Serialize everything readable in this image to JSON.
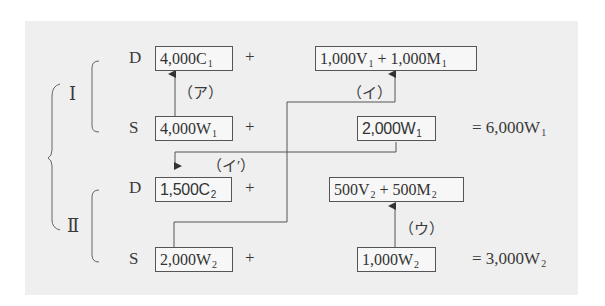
{
  "groups": {
    "I": {
      "label": "Ⅰ"
    },
    "II": {
      "label": "Ⅱ"
    }
  },
  "rows": {
    "I_D": {
      "prefix": "D",
      "c_box": {
        "value": "4,000C",
        "sub": "1"
      },
      "plus": "+",
      "vm_box": {
        "v": "1,000V",
        "v_sub": "1",
        "op": " + ",
        "m": "1,000M",
        "m_sub": "1"
      }
    },
    "I_S": {
      "prefix": "S",
      "w_box": {
        "value": "4,000W",
        "sub": "1"
      },
      "plus": "+",
      "w2_box": {
        "value": "2,000W",
        "sub": "1"
      },
      "total": {
        "value": "= 6,000W",
        "sub": "1"
      }
    },
    "II_D": {
      "prefix": "D",
      "c_box": {
        "value": "1,500C",
        "sub": "2"
      },
      "plus": "+",
      "vm_box": {
        "v": "500V",
        "v_sub": "2",
        "op": " + ",
        "m": "500M",
        "m_sub": "2"
      }
    },
    "II_S": {
      "prefix": "S",
      "w_box": {
        "value": "2,000W",
        "sub": "2"
      },
      "plus": "+",
      "w2_box": {
        "value": "1,000W",
        "sub": "2"
      },
      "total": {
        "value": "= 3,000W",
        "sub": "2"
      }
    }
  },
  "arrow_labels": {
    "a": "（ア）",
    "i": "（イ）",
    "i_prime": "（イ′）",
    "u": "（ウ）"
  },
  "colors": {
    "panel": "#efefef",
    "line": "#555555",
    "text": "#3a3a3a"
  }
}
